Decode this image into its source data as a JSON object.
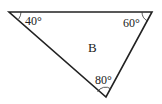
{
  "diagram": {
    "shape": "triangle",
    "name": "B",
    "vertices": [
      {
        "id": "top-left",
        "x": 9,
        "y": 12,
        "angle": "40°"
      },
      {
        "id": "top-right",
        "x": 152,
        "y": 12,
        "angle": "60°"
      },
      {
        "id": "bottom",
        "x": 106,
        "y": 97,
        "angle": "80°"
      }
    ],
    "stroke_color": "#222222"
  }
}
